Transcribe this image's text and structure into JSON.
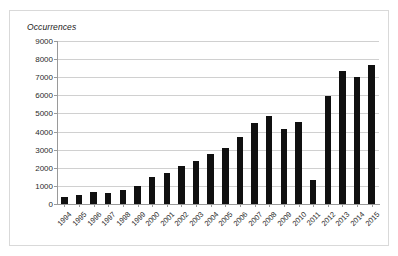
{
  "figure": {
    "y_axis_title": "Occurrences",
    "background": "#ffffff",
    "border_color": "#d9d9d9",
    "bar_color": "#101010",
    "grid_color": "#d0d0d0",
    "axis_color": "#9a9a9a"
  },
  "chart_data": {
    "type": "bar",
    "title": "",
    "xlabel": "",
    "ylabel": "Occurrences",
    "ylim": [
      0,
      9000
    ],
    "ytick_step": 1000,
    "grid": true,
    "legend": "none",
    "categories": [
      "1994",
      "1995",
      "1996",
      "1997",
      "1998",
      "1999",
      "2000",
      "2001",
      "2002",
      "2003",
      "2004",
      "2005",
      "2006",
      "2007",
      "2008",
      "2009",
      "2010",
      "2011",
      "2012",
      "2013",
      "2014",
      "2015"
    ],
    "values": [
      400,
      500,
      650,
      600,
      800,
      1000,
      1500,
      1700,
      2100,
      2400,
      2750,
      3100,
      3700,
      4500,
      4850,
      4150,
      4550,
      1300,
      5950,
      7350,
      7000,
      7700
    ],
    "ytick_labels": [
      "9000",
      "8000",
      "7000",
      "6000",
      "5000",
      "4000",
      "3000",
      "2000",
      "1000",
      "0"
    ],
    "ytick_values": [
      9000,
      8000,
      7000,
      6000,
      5000,
      4000,
      3000,
      2000,
      1000,
      0
    ]
  }
}
